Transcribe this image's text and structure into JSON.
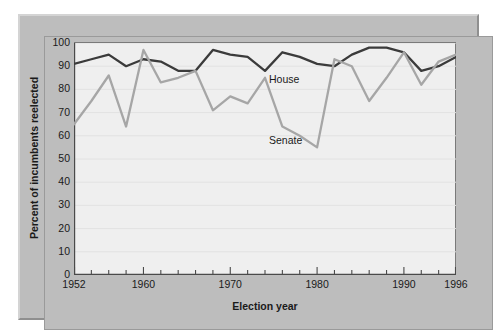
{
  "chart_data": {
    "type": "line",
    "title": "",
    "subtitle": "",
    "xlabel": "Election year",
    "ylabel": "Percent of incumbents reelected",
    "x": [
      1952,
      1954,
      1956,
      1958,
      1960,
      1962,
      1964,
      1966,
      1968,
      1970,
      1972,
      1974,
      1976,
      1978,
      1980,
      1982,
      1984,
      1986,
      1988,
      1990,
      1992,
      1994,
      1996
    ],
    "xlim": [
      1952,
      1996
    ],
    "ylim": [
      0,
      100
    ],
    "xtick_labels": [
      "1952",
      "1960",
      "1970",
      "1980",
      "1990",
      "1996"
    ],
    "xtick_values": [
      1952,
      1960,
      1970,
      1980,
      1990,
      1996
    ],
    "xtick_minor_step": 2,
    "ytick_labels": [
      "0",
      "10",
      "20",
      "30",
      "40",
      "50",
      "60",
      "70",
      "80",
      "90",
      "100"
    ],
    "ytick_values": [
      0,
      10,
      20,
      30,
      40,
      50,
      60,
      70,
      80,
      90,
      100
    ],
    "grid": "horizontal",
    "legend_position": "inline-annotations",
    "series": [
      {
        "name": "House",
        "color": "#3b3b3b",
        "label_text": "House",
        "values": [
          91,
          93,
          95,
          90,
          93,
          92,
          88,
          88,
          97,
          95,
          94,
          88,
          96,
          94,
          91,
          90,
          95,
          98,
          98,
          96,
          88,
          90,
          94
        ]
      },
      {
        "name": "Senate",
        "color": "#a6a6a6",
        "label_text": "Senate",
        "values": [
          65,
          75,
          86,
          64,
          97,
          83,
          85,
          88,
          71,
          77,
          74,
          85,
          64,
          60,
          55,
          93,
          90,
          75,
          85,
          96,
          82,
          92,
          95
        ]
      }
    ],
    "annotations": [
      {
        "text": "House",
        "series": "House",
        "x": 1974,
        "y": 88
      },
      {
        "text": "Senate",
        "series": "Senate",
        "x": 1977,
        "y": 58
      }
    ]
  },
  "figure": {
    "background_color": "#ffffff",
    "mount_color": "#bdbdbd",
    "plot_background_color": "#efefef",
    "axis_color": "#4a4a4a"
  }
}
